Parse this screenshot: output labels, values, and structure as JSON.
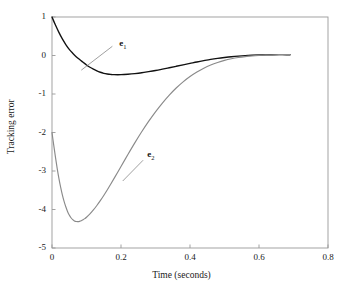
{
  "chart_data": {
    "type": "line",
    "title": "",
    "xlabel": "Time (seconds)",
    "ylabel": "Tracking error",
    "xlim": [
      0,
      0.8
    ],
    "ylim": [
      -5,
      1
    ],
    "xticks": [
      "0",
      "0.2",
      "0.4",
      "0.6",
      "0.8"
    ],
    "xtick_values": [
      0,
      0.2,
      0.4,
      0.6,
      0.8
    ],
    "yticks": [
      "1",
      "0",
      "-1",
      "-2",
      "-3",
      "-4",
      "-5"
    ],
    "ytick_values": [
      1,
      0,
      -1,
      -2,
      -3,
      -4,
      -5
    ],
    "grid": false,
    "legend": "inline-annotations",
    "series": [
      {
        "name": "e1",
        "label_text": "e",
        "label_sub": "1",
        "color": "#111111",
        "annotation_x": 0.195,
        "annotation_y": 0.3,
        "leader_from_x": 0.175,
        "leader_from_y": 0.24,
        "leader_to_x": 0.085,
        "leader_to_y": -0.38,
        "x": [
          0.0,
          0.01,
          0.02,
          0.03,
          0.04,
          0.05,
          0.06,
          0.07,
          0.08,
          0.09,
          0.1,
          0.11,
          0.12,
          0.13,
          0.14,
          0.15,
          0.16,
          0.17,
          0.18,
          0.2,
          0.22,
          0.24,
          0.26,
          0.28,
          0.3,
          0.32,
          0.34,
          0.36,
          0.38,
          0.4,
          0.42,
          0.44,
          0.46,
          0.48,
          0.5,
          0.52,
          0.54,
          0.56,
          0.58,
          0.6,
          0.62,
          0.64,
          0.66,
          0.68,
          0.69
        ],
        "y": [
          1.0,
          0.79,
          0.6,
          0.43,
          0.285,
          0.16,
          0.06,
          -0.03,
          -0.105,
          -0.175,
          -0.245,
          -0.305,
          -0.355,
          -0.4,
          -0.435,
          -0.462,
          -0.48,
          -0.492,
          -0.498,
          -0.498,
          -0.487,
          -0.47,
          -0.448,
          -0.42,
          -0.39,
          -0.355,
          -0.318,
          -0.28,
          -0.242,
          -0.205,
          -0.168,
          -0.134,
          -0.102,
          -0.075,
          -0.052,
          -0.032,
          -0.016,
          -0.003,
          0.006,
          0.013,
          0.018,
          0.02,
          0.021,
          0.02,
          0.02
        ]
      },
      {
        "name": "e2",
        "label_text": "e",
        "label_sub": "2",
        "color": "#8a8a8a",
        "annotation_x": 0.276,
        "annotation_y": -2.58,
        "leader_from_x": 0.264,
        "leader_from_y": -2.72,
        "leader_to_x": 0.205,
        "leader_to_y": -3.26,
        "x": [
          0.0,
          0.005,
          0.01,
          0.015,
          0.02,
          0.025,
          0.03,
          0.035,
          0.04,
          0.045,
          0.05,
          0.055,
          0.06,
          0.065,
          0.07,
          0.075,
          0.08,
          0.085,
          0.09,
          0.095,
          0.1,
          0.11,
          0.12,
          0.13,
          0.14,
          0.15,
          0.16,
          0.17,
          0.18,
          0.19,
          0.2,
          0.22,
          0.24,
          0.26,
          0.28,
          0.3,
          0.32,
          0.34,
          0.36,
          0.38,
          0.4,
          0.42,
          0.44,
          0.46,
          0.48,
          0.5,
          0.52,
          0.54,
          0.56,
          0.58,
          0.6,
          0.62,
          0.64,
          0.66,
          0.68,
          0.69
        ],
        "y": [
          -2.0,
          -2.33,
          -2.64,
          -2.93,
          -3.19,
          -3.42,
          -3.62,
          -3.79,
          -3.93,
          -4.05,
          -4.145,
          -4.215,
          -4.265,
          -4.296,
          -4.312,
          -4.315,
          -4.308,
          -4.292,
          -4.268,
          -4.238,
          -4.202,
          -4.115,
          -4.012,
          -3.896,
          -3.77,
          -3.635,
          -3.492,
          -3.344,
          -3.192,
          -3.038,
          -2.882,
          -2.572,
          -2.27,
          -1.982,
          -1.712,
          -1.462,
          -1.234,
          -1.028,
          -0.845,
          -0.685,
          -0.546,
          -0.428,
          -0.33,
          -0.248,
          -0.182,
          -0.128,
          -0.086,
          -0.053,
          -0.028,
          -0.01,
          0.003,
          0.012,
          0.018,
          0.021,
          0.022,
          0.022
        ]
      }
    ]
  },
  "axes": {
    "frame_color": "#999999"
  }
}
